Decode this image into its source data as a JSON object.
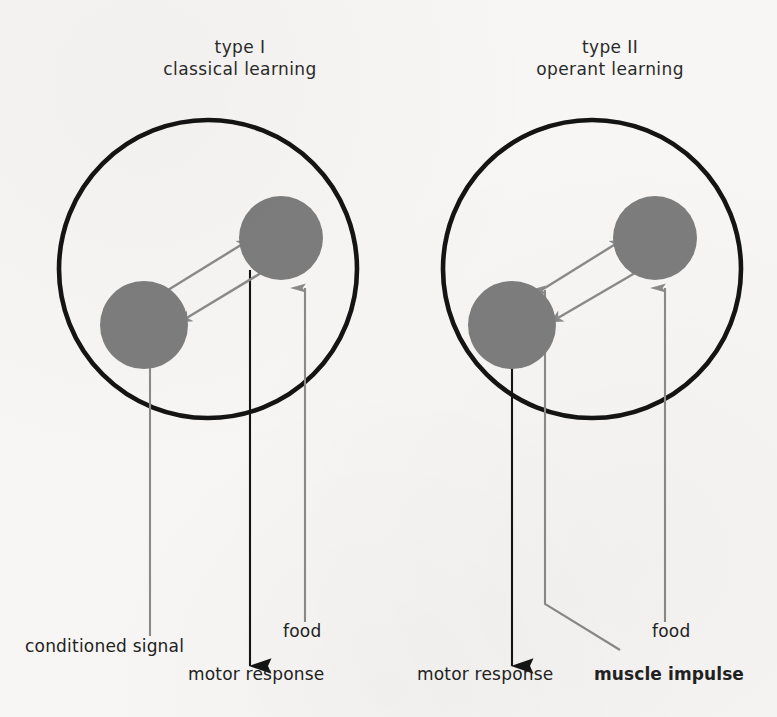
{
  "figure": {
    "kind": "conceptual-diagram",
    "background_color": "#f7f6f4",
    "node_color": "#7d7d7d",
    "outline_color": "#111111",
    "gray_arrow_color": "#8a8a8a",
    "black_arrow_color": "#111111"
  },
  "panels": [
    {
      "id": "left",
      "title_line1": "type I",
      "title_line2": "classical learning",
      "circle": {
        "cx": 208,
        "cy": 269,
        "r": 149
      },
      "nodes": [
        {
          "name": "lower-left-node",
          "cx": 144,
          "cy": 325,
          "r": 44
        },
        {
          "name": "upper-right-node",
          "cx": 281,
          "cy": 238,
          "r": 42
        }
      ],
      "internal_arrows": [
        {
          "name": "forward-link",
          "from": "lower-left-node",
          "to": "upper-right-node",
          "color": "#8a8a8a"
        },
        {
          "name": "return-link",
          "from": "upper-right-node",
          "to": "lower-left-node",
          "color": "#8a8a8a"
        }
      ],
      "external_arrows": [
        {
          "name": "conditioned-signal-arrow",
          "label": "conditioned signal",
          "direction": "up",
          "color": "#8a8a8a",
          "x": 150
        },
        {
          "name": "motor-response-arrow",
          "label": "motor response",
          "direction": "down",
          "color": "#111111",
          "x": 250
        },
        {
          "name": "food-arrow",
          "label": "food",
          "direction": "up",
          "color": "#8a8a8a",
          "x": 305
        }
      ]
    },
    {
      "id": "right",
      "title_line1": "type II",
      "title_line2": "operant learning",
      "circle": {
        "cx": 592,
        "cy": 269,
        "r": 149
      },
      "nodes": [
        {
          "name": "lower-left-node",
          "cx": 512,
          "cy": 325,
          "r": 44
        },
        {
          "name": "upper-right-node",
          "cx": 655,
          "cy": 238,
          "r": 42
        }
      ],
      "internal_arrows": [
        {
          "name": "forward-link",
          "from": "lower-left-node",
          "to": "upper-right-node",
          "color": "#8a8a8a"
        },
        {
          "name": "return-link",
          "from": "upper-right-node",
          "to": "lower-left-node",
          "color": "#8a8a8a"
        }
      ],
      "external_arrows": [
        {
          "name": "motor-response-arrow",
          "label": "motor response",
          "direction": "down",
          "color": "#111111",
          "x": 512
        },
        {
          "name": "muscle-impulse-arrow",
          "label": "muscle impulse",
          "direction": "up",
          "color": "#8a8a8a",
          "x": 545,
          "bent": true
        },
        {
          "name": "food-arrow",
          "label": "food",
          "direction": "up",
          "color": "#8a8a8a",
          "x": 665
        }
      ]
    }
  ],
  "captions": {
    "conditioned_signal": "conditioned signal",
    "motor_response_left": "motor response",
    "food_left": "food",
    "motor_response_right": "motor response",
    "muscle_impulse": "muscle impulse",
    "food_right": "food"
  }
}
